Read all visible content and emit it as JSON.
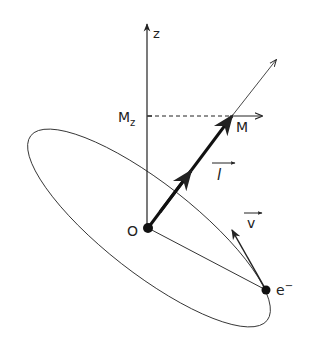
{
  "diagram": {
    "type": "physics-vector-diagram",
    "labels": {
      "z_axis": "z",
      "origin": "O",
      "mz": "M",
      "mz_sub": "z",
      "moment": "M",
      "angular_momentum": "l",
      "velocity": "v",
      "electron": "e",
      "electron_sup": "−"
    },
    "colors": {
      "ink": "#222222",
      "background": "#ffffff"
    }
  }
}
